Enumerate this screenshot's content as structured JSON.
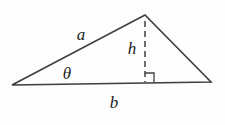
{
  "figure": {
    "type": "geometry-diagram",
    "labels": {
      "side_a": "a",
      "angle_theta": "θ",
      "height_h": "h",
      "base_b": "b"
    },
    "colors": {
      "line": "#3e3e3e",
      "text": "#1c1c1c",
      "background": "#fdfdfd"
    }
  }
}
